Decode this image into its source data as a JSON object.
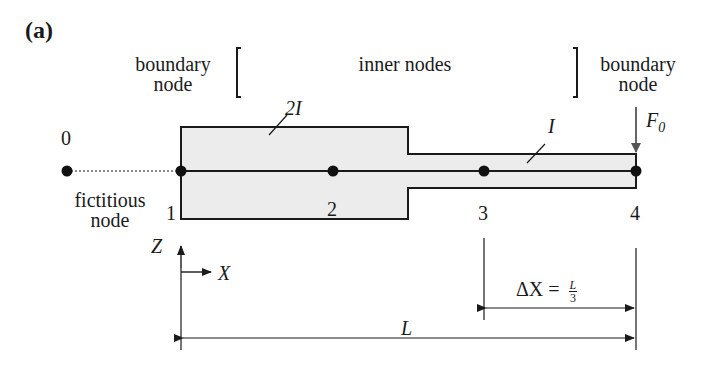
{
  "panel_label": "(a)",
  "labels": {
    "boundary_left_1": "boundary",
    "boundary_left_2": "node",
    "inner": "inner nodes",
    "boundary_right_1": "boundary",
    "boundary_right_2": "node",
    "fictitious_1": "fictitious",
    "fictitious_2": "node",
    "inertia_wide": "2I",
    "inertia_narrow": "I",
    "force": "F",
    "force_sub": "0",
    "axis_z": "Z",
    "axis_x": "X",
    "length_total": "L",
    "delta_lhs": "ΔX =",
    "delta_num": "L",
    "delta_den": "3"
  },
  "nodes": [
    {
      "id": "0",
      "x": 67,
      "y": 171,
      "type": "fictitious"
    },
    {
      "id": "1",
      "x": 181,
      "y": 171,
      "type": "boundary"
    },
    {
      "id": "2",
      "x": 333,
      "y": 171,
      "type": "inner"
    },
    {
      "id": "3",
      "x": 484,
      "y": 171,
      "type": "inner"
    },
    {
      "id": "4",
      "x": 636,
      "y": 171,
      "type": "boundary"
    }
  ],
  "colors": {
    "ink": "#1a1a1a",
    "beam_fill": "#ececec",
    "arrow": "#555555"
  }
}
